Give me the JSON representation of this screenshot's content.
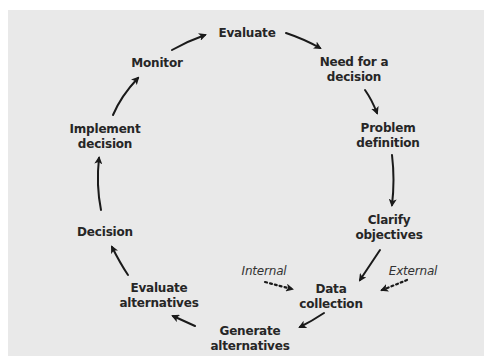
{
  "diagram": {
    "type": "cycle",
    "colors": {
      "background": "#e9e9e9",
      "text": "#262626",
      "arrow": "#1a1a1a"
    },
    "nodes": [
      {
        "id": "evaluate",
        "lines": [
          "Evaluate"
        ]
      },
      {
        "id": "need",
        "lines": [
          "Need for a",
          "decision"
        ]
      },
      {
        "id": "problem",
        "lines": [
          "Problem",
          "definition"
        ]
      },
      {
        "id": "clarify",
        "lines": [
          "Clarify",
          "objectives"
        ]
      },
      {
        "id": "data",
        "lines": [
          "Data",
          "collection"
        ]
      },
      {
        "id": "generate",
        "lines": [
          "Generate",
          "alternatives"
        ]
      },
      {
        "id": "evalalt",
        "lines": [
          "Evaluate",
          "alternatives"
        ]
      },
      {
        "id": "decision",
        "lines": [
          "Decision"
        ]
      },
      {
        "id": "implement",
        "lines": [
          "Implement",
          "decision"
        ]
      },
      {
        "id": "monitor",
        "lines": [
          "Monitor"
        ]
      }
    ],
    "inputs": [
      {
        "id": "internal",
        "label": "Internal",
        "target": "data",
        "style": "dotted"
      },
      {
        "id": "external",
        "label": "External",
        "target": "data",
        "style": "dotted"
      }
    ],
    "edges": [
      {
        "from": "evaluate",
        "to": "need"
      },
      {
        "from": "need",
        "to": "problem"
      },
      {
        "from": "problem",
        "to": "clarify"
      },
      {
        "from": "clarify",
        "to": "data"
      },
      {
        "from": "data",
        "to": "generate"
      },
      {
        "from": "generate",
        "to": "evalalt"
      },
      {
        "from": "evalalt",
        "to": "decision"
      },
      {
        "from": "decision",
        "to": "implement"
      },
      {
        "from": "implement",
        "to": "monitor"
      },
      {
        "from": "monitor",
        "to": "evaluate"
      }
    ]
  }
}
